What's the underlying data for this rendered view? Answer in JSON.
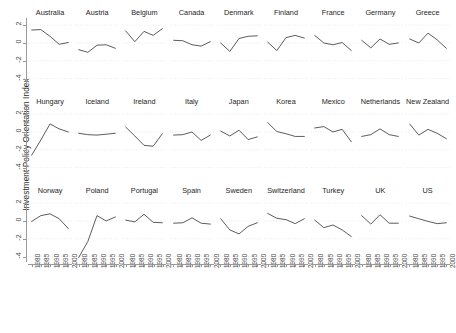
{
  "chart_data": {
    "type": "line",
    "title": "",
    "ylabel": "Investment Policy Orientation Index",
    "xlabel": "",
    "ylim": [
      -4.6,
      2.8
    ],
    "xlim": [
      1978,
      2002
    ],
    "yticks": [
      2,
      0,
      -2,
      -4
    ],
    "ytick_labels": [
      "2",
      "0",
      "-2",
      "-4"
    ],
    "xticks": [
      1980,
      1985,
      1990,
      1995,
      2000
    ],
    "xtick_labels": [
      "1980",
      "1985",
      "1990",
      "1995",
      "2000"
    ],
    "grid": true,
    "legend": "none",
    "layout": {
      "rows": 3,
      "cols": 9
    },
    "x": [
      1980,
      1985,
      1990,
      1995,
      2000
    ],
    "series": [
      {
        "name": "Australia",
        "row": 0,
        "col": 0,
        "values": [
          1.45,
          1.5,
          0.75,
          -0.15,
          0.05
        ]
      },
      {
        "name": "Austria",
        "row": 0,
        "col": 1,
        "values": [
          -0.75,
          -1.05,
          -0.25,
          -0.2,
          -0.6
        ]
      },
      {
        "name": "Belgium",
        "row": 0,
        "col": 2,
        "values": [
          1.35,
          0.15,
          1.3,
          0.85,
          1.6
        ]
      },
      {
        "name": "Canada",
        "row": 0,
        "col": 3,
        "values": [
          0.3,
          0.25,
          -0.2,
          -0.35,
          0.15
        ]
      },
      {
        "name": "Denmark",
        "row": 0,
        "col": 4,
        "values": [
          0.0,
          -0.95,
          0.5,
          0.75,
          0.8
        ]
      },
      {
        "name": "Finland",
        "row": 0,
        "col": 5,
        "values": [
          0.1,
          -0.85,
          0.6,
          0.85,
          0.55
        ]
      },
      {
        "name": "France",
        "row": 0,
        "col": 6,
        "values": [
          0.85,
          0.0,
          -0.2,
          0.05,
          -0.85
        ]
      },
      {
        "name": "Germany",
        "row": 0,
        "col": 7,
        "values": [
          0.3,
          -0.55,
          0.45,
          -0.15,
          0.0
        ]
      },
      {
        "name": "Greece",
        "row": 0,
        "col": 8,
        "values": [
          0.45,
          0.0,
          1.1,
          0.35,
          -0.6
        ]
      },
      {
        "name": "Hungary",
        "row": 1,
        "col": 0,
        "values": [
          -2.6,
          -0.9,
          0.9,
          0.35,
          0.0
        ]
      },
      {
        "name": "Iceland",
        "row": 1,
        "col": 1,
        "values": [
          -0.15,
          -0.3,
          -0.35,
          -0.25,
          -0.15
        ]
      },
      {
        "name": "Ireland",
        "row": 1,
        "col": 2,
        "values": [
          0.55,
          -0.45,
          -1.5,
          -1.6,
          -0.2
        ]
      },
      {
        "name": "Italy",
        "row": 1,
        "col": 3,
        "values": [
          -0.35,
          -0.3,
          0.0,
          -0.95,
          -0.35
        ]
      },
      {
        "name": "Japan",
        "row": 1,
        "col": 4,
        "values": [
          0.1,
          -0.45,
          0.2,
          -0.85,
          -0.55
        ]
      },
      {
        "name": "Korea",
        "row": 1,
        "col": 5,
        "values": [
          1.05,
          0.05,
          -0.2,
          -0.5,
          -0.5
        ]
      },
      {
        "name": "Mexico",
        "row": 1,
        "col": 6,
        "values": [
          0.45,
          0.6,
          0.0,
          0.3,
          -1.1
        ]
      },
      {
        "name": "Netherlands",
        "row": 1,
        "col": 7,
        "values": [
          -0.5,
          -0.3,
          0.35,
          -0.3,
          -0.5
        ]
      },
      {
        "name": "New Zealand",
        "row": 1,
        "col": 8,
        "values": [
          0.9,
          -0.35,
          0.3,
          -0.15,
          -0.75
        ]
      },
      {
        "name": "Norway",
        "row": 2,
        "col": 0,
        "values": [
          -0.05,
          0.6,
          0.8,
          0.25,
          -0.85
        ]
      },
      {
        "name": "Poland",
        "row": 2,
        "col": 1,
        "values": [
          -4.1,
          -2.3,
          0.6,
          0.0,
          0.45
        ]
      },
      {
        "name": "Portugal",
        "row": 2,
        "col": 2,
        "values": [
          0.1,
          -0.1,
          0.75,
          -0.15,
          -0.2
        ]
      },
      {
        "name": "Spain",
        "row": 2,
        "col": 3,
        "values": [
          -0.25,
          -0.2,
          0.35,
          -0.25,
          -0.35
        ]
      },
      {
        "name": "Sweden",
        "row": 2,
        "col": 4,
        "values": [
          0.25,
          -1.0,
          -1.45,
          -0.6,
          -0.2
        ]
      },
      {
        "name": "Switzerland",
        "row": 2,
        "col": 5,
        "values": [
          0.85,
          0.3,
          0.15,
          -0.3,
          0.25
        ]
      },
      {
        "name": "Turkey",
        "row": 2,
        "col": 6,
        "values": [
          0.1,
          -0.75,
          -0.45,
          -1.0,
          -1.75
        ]
      },
      {
        "name": "UK",
        "row": 2,
        "col": 7,
        "values": [
          0.6,
          -0.35,
          0.7,
          -0.25,
          -0.25
        ]
      },
      {
        "name": "US",
        "row": 2,
        "col": 8,
        "values": [
          0.55,
          0.25,
          -0.05,
          -0.3,
          -0.2
        ]
      }
    ],
    "colors": {
      "line": "#4a4a4a",
      "grid": "#e6e6e6",
      "axis": "#9a9a9a",
      "text": "#2b2b2b"
    }
  },
  "caption": ""
}
